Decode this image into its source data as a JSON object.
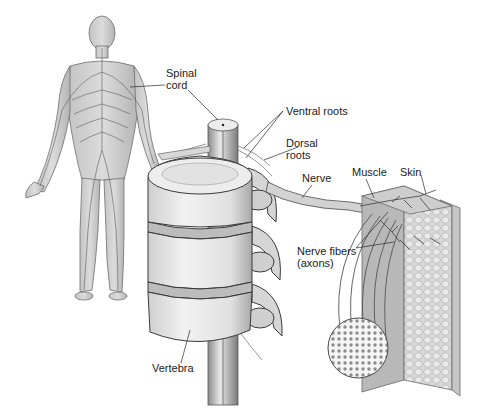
{
  "figure": {
    "style": "grayscale anatomical illustration",
    "colors": {
      "background": "#ffffff",
      "ink": "#1a1a1a",
      "bone": "#e6e6e6",
      "bone_shade": "#b8b8b8",
      "tissue": "#cfcfcf",
      "tissue_dark": "#9a9a9a"
    }
  },
  "labels": {
    "spinal_cord": {
      "line1": "Spinal",
      "line2": "cord"
    },
    "ventral_roots": "Ventral roots",
    "dorsal_roots": {
      "line1": "Dorsal",
      "line2": "roots"
    },
    "nerve": "Nerve",
    "muscle": "Muscle",
    "skin": "Skin",
    "nerve_fibers": {
      "line1": "Nerve fibers",
      "line2": "(axons)"
    },
    "vertebra": "Vertebra"
  },
  "parts": [
    {
      "name": "human-figure",
      "description": "Full-body human figure showing nervous system"
    },
    {
      "name": "spinal-cord",
      "description": "Spinal cord passing through vertebral column"
    },
    {
      "name": "vertebral-column",
      "description": "Stack of three vertebrae with intervertebral discs"
    },
    {
      "name": "peripheral-nerve",
      "description": "Nerve branching to muscle and skin"
    },
    {
      "name": "nerve-cross-section",
      "description": "Circular cross-section showing bundled axons"
    },
    {
      "name": "muscle-skin-block",
      "description": "Tissue block showing muscle and skin layers"
    }
  ]
}
